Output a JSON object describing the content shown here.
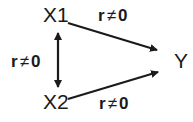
{
  "nodes": {
    "x1": {
      "label": "X1"
    },
    "x2": {
      "label": "X2"
    },
    "y": {
      "label": "Y"
    }
  },
  "edges": {
    "x1_y": {
      "from": "X1",
      "to": "Y",
      "type": "directed",
      "var": "r",
      "relation": "≠",
      "value": "0"
    },
    "x2_y": {
      "from": "X2",
      "to": "Y",
      "type": "directed",
      "var": "r",
      "relation": "≠",
      "value": "0"
    },
    "x1_x2": {
      "from": "X1",
      "to": "X2",
      "type": "bidirectional",
      "var": "r",
      "relation": "≠",
      "value": "0"
    }
  },
  "colors": {
    "ink": "#1a1a1a",
    "background": "#ffffff"
  }
}
